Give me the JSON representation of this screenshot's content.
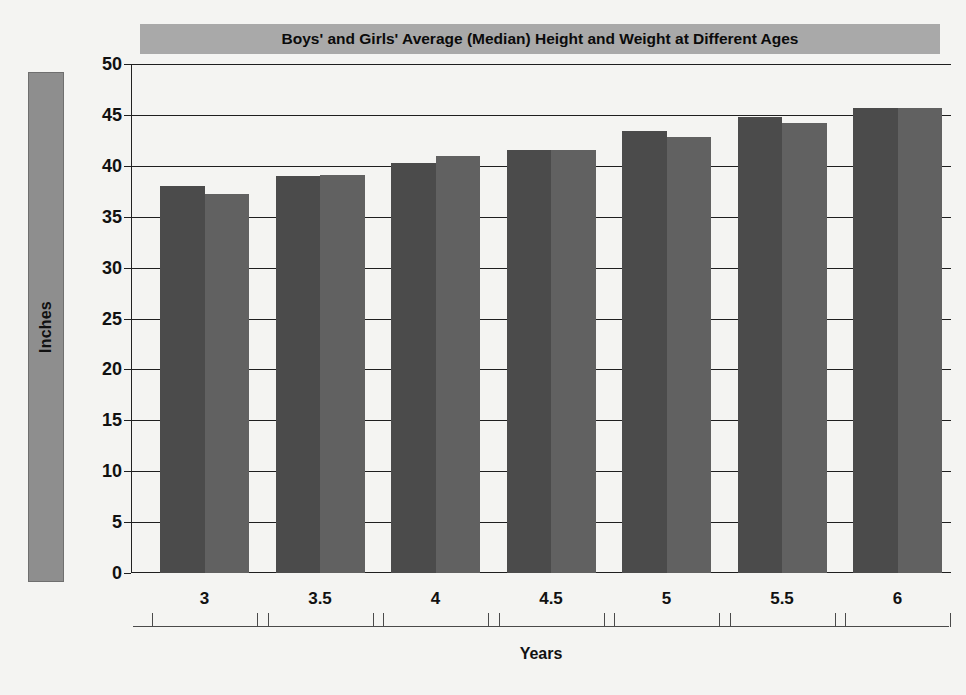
{
  "chart_data": {
    "type": "bar",
    "title": "Boys' and Girls' Average (Median) Height and Weight at Different Ages",
    "xlabel": "Years",
    "ylabel": "Inches",
    "categories": [
      "3",
      "3.5",
      "4",
      "4.5",
      "5",
      "5.5",
      "6"
    ],
    "series": [
      {
        "name": "Boys",
        "values": [
          38.0,
          39.0,
          40.3,
          41.6,
          43.4,
          44.8,
          45.7
        ]
      },
      {
        "name": "Girls",
        "values": [
          37.2,
          39.1,
          41.0,
          41.6,
          42.8,
          44.2,
          45.7
        ]
      }
    ],
    "ylim": [
      0,
      50
    ],
    "yticks": [
      0,
      5,
      10,
      15,
      20,
      25,
      30,
      35,
      40,
      45,
      50
    ],
    "ytick_labels": [
      "0",
      "5",
      "10",
      "15",
      "20",
      "25",
      "30",
      "35",
      "40",
      "45",
      "50"
    ],
    "grid": true,
    "legend": "none",
    "colors": {
      "boys": "#4b4b4b",
      "girls": "#616161",
      "title_band": "#a9a9a9",
      "axis_band": "#8e8e8e",
      "gridline": "#1f1f1f",
      "background": "#f4f4f2"
    }
  }
}
